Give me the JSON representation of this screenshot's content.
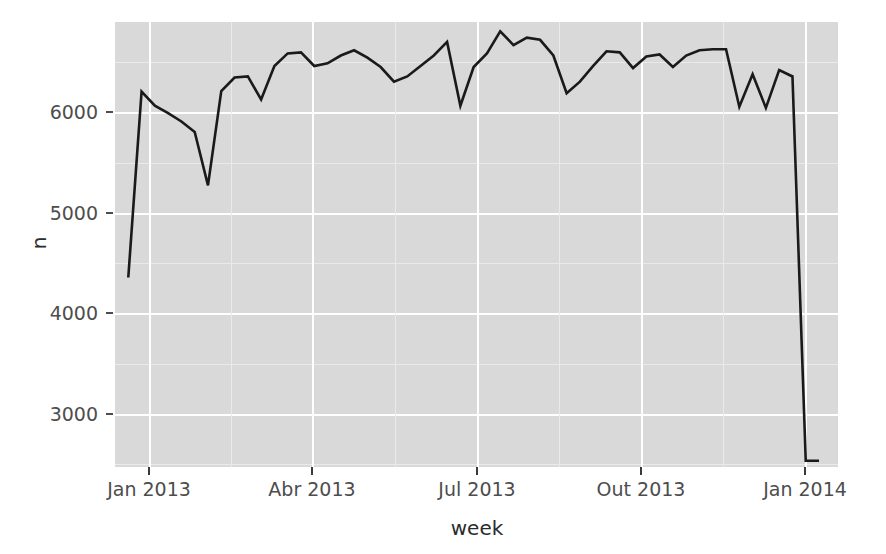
{
  "chart_data": {
    "type": "line",
    "title": "",
    "subtitle": "",
    "xlabel": "week",
    "ylabel": "n",
    "grid": true,
    "legend": "none",
    "line_color": "#1a1a1a",
    "panel_color": "#d9d9d9",
    "gridline_color": "#ffffff",
    "x_type": "date",
    "xlim": [
      "2012-12-25",
      "2014-01-10"
    ],
    "ylim": [
      2500,
      6750
    ],
    "y_ticks": [
      3000,
      4000,
      5000,
      6000
    ],
    "y_tick_labels": [
      "3000",
      "4000",
      "5000",
      "6000"
    ],
    "x_ticks": [
      "2013-01-01",
      "2013-04-01",
      "2013-07-01",
      "2013-10-01",
      "2014-01-01"
    ],
    "x_tick_labels": [
      "Jan 2013",
      "Abr 2013",
      "Jul 2013",
      "Out 2013",
      "Jan 2014"
    ],
    "series": [
      {
        "name": "n",
        "x": [
          "2013-01-01",
          "2013-01-08",
          "2013-01-15",
          "2013-01-22",
          "2013-01-29",
          "2013-02-05",
          "2013-02-12",
          "2013-02-19",
          "2013-02-26",
          "2013-03-05",
          "2013-03-12",
          "2013-03-19",
          "2013-03-26",
          "2013-04-02",
          "2013-04-09",
          "2013-04-16",
          "2013-04-23",
          "2013-04-30",
          "2013-05-07",
          "2013-05-14",
          "2013-05-21",
          "2013-05-28",
          "2013-06-04",
          "2013-06-11",
          "2013-06-18",
          "2013-06-25",
          "2013-07-02",
          "2013-07-09",
          "2013-07-16",
          "2013-07-23",
          "2013-07-30",
          "2013-08-06",
          "2013-08-13",
          "2013-08-20",
          "2013-08-27",
          "2013-09-03",
          "2013-09-10",
          "2013-09-17",
          "2013-09-24",
          "2013-10-01",
          "2013-10-08",
          "2013-10-15",
          "2013-10-22",
          "2013-10-29",
          "2013-11-05",
          "2013-11-12",
          "2013-11-19",
          "2013-11-26",
          "2013-12-03",
          "2013-12-10",
          "2013-12-17",
          "2013-12-24",
          "2013-12-31"
        ],
        "values": [
          4310,
          6085,
          5950,
          5880,
          5800,
          5700,
          5190,
          6090,
          6220,
          6230,
          6010,
          6330,
          6450,
          6460,
          6330,
          6355,
          6430,
          6480,
          6410,
          6320,
          6180,
          6230,
          6330,
          6430,
          6560,
          5950,
          6320,
          6450,
          6660,
          6530,
          6600,
          6580,
          6430,
          6070,
          6180,
          6330,
          6470,
          6460,
          6310,
          6420,
          6440,
          6320,
          6430,
          6480,
          6490,
          6490,
          5940,
          6250,
          5930,
          6290,
          6230,
          2560,
          2560
        ]
      }
    ],
    "data_points_pixel_note": "line traced from panel pixels"
  },
  "axes": {
    "y_title": "n",
    "x_title": "week",
    "y_ticks": [
      "6000",
      "5000",
      "4000",
      "3000"
    ],
    "x_ticks": [
      "Jan 2013",
      "Abr 2013",
      "Jul 2013",
      "Out 2013",
      "Jan 2014"
    ]
  }
}
